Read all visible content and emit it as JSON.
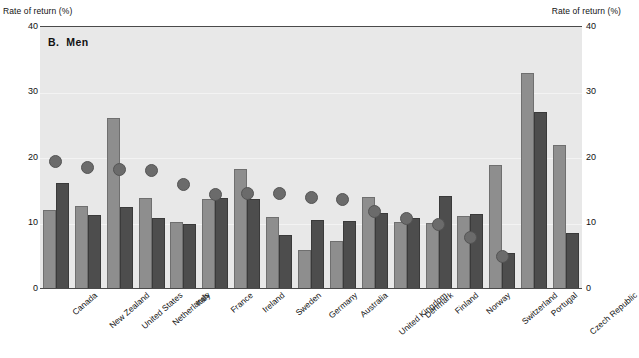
{
  "axis_titles": {
    "left": "Rate of return (%)",
    "right": "Rate of return (%)"
  },
  "panel": {
    "letter": "B.",
    "name": "Men"
  },
  "chart_data": {
    "type": "bar",
    "xlabel": "",
    "ylabel": "Rate of return (%)",
    "ylim": [
      0,
      40
    ],
    "yticks": [
      0,
      10,
      20,
      30,
      40
    ],
    "grid": true,
    "legend": "none",
    "dual_axis": true,
    "categories": [
      "Canada",
      "New Zealand",
      "United States",
      "Netherlands",
      "Italy",
      "France",
      "Ireland",
      "Sweden",
      "Germany",
      "Australia",
      "United Kingdom",
      "Denmark",
      "Finland",
      "Norway",
      "Switzerland",
      "Portugal",
      "Czech Republic"
    ],
    "series": [
      {
        "name": "light-bar",
        "color": "#8e8e8e",
        "values": [
          12.1,
          12.7,
          26.1,
          13.9,
          10.2,
          13.7,
          18.3,
          11.0,
          6.0,
          7.3,
          14.0,
          10.2,
          10.1,
          11.2,
          18.9,
          33.0,
          22.0
        ]
      },
      {
        "name": "dark-bar",
        "color": "#4d4d4d",
        "values": [
          16.2,
          11.3,
          12.5,
          10.8,
          9.9,
          13.9,
          13.7,
          8.2,
          10.5,
          10.4,
          11.6,
          10.8,
          14.2,
          11.5,
          5.5,
          27.0,
          8.5
        ]
      },
      {
        "name": "dot-marker",
        "color": "#6b6b6b",
        "values": [
          19.5,
          18.6,
          18.3,
          18.1,
          16.0,
          14.5,
          14.6,
          14.6,
          14.0,
          13.7,
          11.8,
          10.8,
          9.9,
          7.9,
          5.0,
          null,
          null
        ]
      }
    ]
  }
}
